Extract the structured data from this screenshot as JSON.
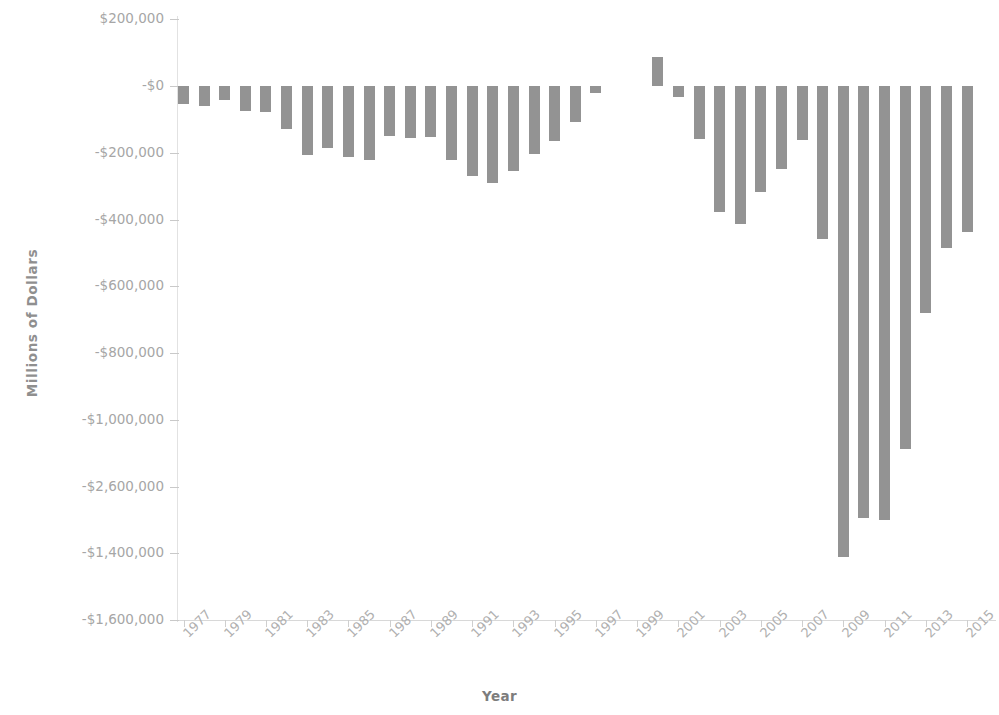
{
  "chart_data": {
    "type": "bar",
    "title": "",
    "subtitle": "",
    "xlabel": "Year",
    "ylabel": "Millions of Dollars",
    "grid": false,
    "legend": "none",
    "bar_color": "#939393",
    "axis_text_color": "#a6a6a6",
    "ylim": [
      -1600000,
      200000
    ],
    "y_tick_values": [
      200000,
      0,
      -200000,
      -400000,
      -600000,
      -800000,
      -1000000,
      -1200000,
      -1400000,
      -1600000
    ],
    "y_tick_labels": [
      "$200,000",
      "-$0",
      "-$200,000",
      "-$400,000",
      "-$600,000",
      "-$800,000",
      "-$1,000,000",
      "-$2,600,000",
      "-$1,400,000",
      "-$1,600,000"
    ],
    "x_tick_labels": [
      "1977",
      "1979",
      "1981",
      "1983",
      "1985",
      "1987",
      "1989",
      "1991",
      "1993",
      "1995",
      "1997",
      "1999",
      "2001",
      "2003",
      "2005",
      "2007",
      "2009",
      "2011",
      "2013",
      "2015"
    ],
    "categories": [
      "1977",
      "1978",
      "1979",
      "1980",
      "1981",
      "1982",
      "1983",
      "1984",
      "1985",
      "1986",
      "1987",
      "1988",
      "1989",
      "1990",
      "1991",
      "1992",
      "1993",
      "1994",
      "1995",
      "1996",
      "1997",
      "1998",
      "1999",
      "2000",
      "2001",
      "2002",
      "2003",
      "2004",
      "2005",
      "2006",
      "2007",
      "2008",
      "2009",
      "2010",
      "2011",
      "2012",
      "2013",
      "2014",
      "2015"
    ],
    "values": [
      -53700,
      -59200,
      -40700,
      -73800,
      -79000,
      -128000,
      -207800,
      -185400,
      -212300,
      -221200,
      -149700,
      -155200,
      -152600,
      -221200,
      -269300,
      -290400,
      -255100,
      -203200,
      -164000,
      -107400,
      -21900,
      0,
      0,
      86400,
      -32400,
      -157800,
      -377600,
      -412700,
      -318300,
      -248200,
      -160700,
      -458600,
      -1412700,
      -1294400,
      -1299700,
      -1087000,
      -679600,
      -484600,
      -438500
    ],
    "bar_pixel_geometry": {
      "note": "values rendered via pixel scale: baseline_y=86, px_per_200k=66.8",
      "baseline_y": 86,
      "px_per_unit": 0.000334
    }
  }
}
